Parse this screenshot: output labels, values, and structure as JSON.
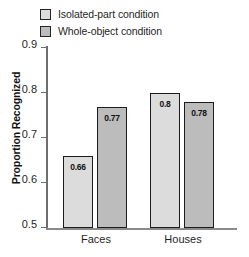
{
  "chart_data": {
    "type": "bar",
    "title": "",
    "xlabel": "",
    "ylabel": "Proportion Recognized",
    "categories": [
      "Faces",
      "Houses"
    ],
    "ylim": [
      0.5,
      0.9
    ],
    "yticks": [
      "0.9",
      "0.8",
      "0.7",
      "0.6",
      "0.5"
    ],
    "ytick_values": [
      0.9,
      0.8,
      0.7,
      0.6,
      0.5
    ],
    "grid": false,
    "legend_position": "top-left",
    "series": [
      {
        "name": "Isolated-part condition",
        "color": "#dcdcdc",
        "values": [
          0.66,
          0.8
        ],
        "labels": [
          "0.66",
          "0.8"
        ]
      },
      {
        "name": "Whole-object condition",
        "color": "#bcbcbc",
        "values": [
          0.77,
          0.78
        ],
        "labels": [
          "0.77",
          "0.78"
        ]
      }
    ]
  },
  "legend": {
    "items": [
      {
        "label": "Isolated-part condition",
        "swatch": "light"
      },
      {
        "label": "Whole-object condition",
        "swatch": "dark"
      }
    ]
  },
  "axes": {
    "y_title": "Proportion Recognized",
    "y_tick_labels": [
      "0.9",
      "0.8",
      "0.7",
      "0.6",
      "0.5"
    ],
    "x_tick_labels": [
      "Faces",
      "Houses"
    ]
  },
  "bars": [
    {
      "group": "Faces",
      "series": "Isolated-part condition",
      "value_label": "0.66"
    },
    {
      "group": "Faces",
      "series": "Whole-object condition",
      "value_label": "0.77"
    },
    {
      "group": "Houses",
      "series": "Isolated-part condition",
      "value_label": "0.8"
    },
    {
      "group": "Houses",
      "series": "Whole-object condition",
      "value_label": "0.78"
    }
  ],
  "colors": {
    "light_bar": "#dcdcdc",
    "dark_bar": "#bcbcbc",
    "bar_edge": "#1c1c1c",
    "axis": "#6e6e6e",
    "text": "#1f1f1f"
  }
}
